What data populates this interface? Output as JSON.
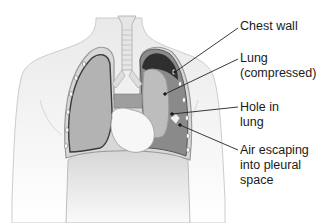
{
  "figure": {
    "labels": [
      {
        "id": "chest-wall",
        "lines": [
          "Chest wall"
        ]
      },
      {
        "id": "lung-compressed",
        "lines": [
          "Lung",
          "(compressed)"
        ]
      },
      {
        "id": "hole-in-lung",
        "lines": [
          "Hole in",
          "lung"
        ]
      },
      {
        "id": "air-escaping",
        "lines": [
          "Air escaping",
          "into pleural",
          "space"
        ]
      }
    ]
  },
  "colors": {
    "body_fill": "#f1f1f1",
    "body_outline": "#c9c9c9",
    "lung_fill": "#b3b3b3",
    "pleural_air_dark": "#3a3a3a",
    "pleural_space": "#8a8a8a",
    "heart_fill": "#f7f7f7",
    "leader_line": "#222222",
    "text": "#1a1a1a"
  }
}
